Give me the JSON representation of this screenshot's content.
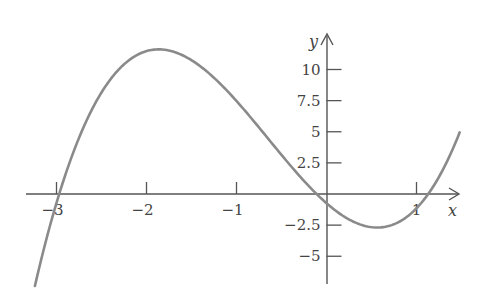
{
  "chart_data": {
    "type": "line",
    "title": "",
    "xlabel": "x",
    "ylabel": "y",
    "xlim": [
      -3.3,
      1.48
    ],
    "ylim": [
      -7.2,
      12.8
    ],
    "grid": false,
    "x_ticks": [
      -3,
      -2,
      -1,
      1
    ],
    "x_tick_labels": [
      "−3",
      "−2",
      "−1",
      "1"
    ],
    "y_ticks": [
      10,
      7.5,
      5,
      2.5,
      -2.5,
      -5
    ],
    "y_tick_labels": [
      "10",
      "7.5",
      "5",
      "2.5",
      "−2.5",
      "−5"
    ],
    "series": [
      {
        "name": "cubic curve",
        "function": "y = 2(x + 2.97)(x + 0.11)(x - 1.13)",
        "color": "#8a8a8a",
        "x_range": [
          -3.24,
          1.48
        ],
        "key_points": [
          {
            "label": "root",
            "x": -2.97,
            "y": 0
          },
          {
            "label": "local max",
            "x": -1.87,
            "y": 11.0
          },
          {
            "label": "root",
            "x": -0.11,
            "y": 0
          },
          {
            "label": "y-intercept",
            "x": 0,
            "y": -0.74
          },
          {
            "label": "local min",
            "x": 0.58,
            "y": -2.7
          },
          {
            "label": "root",
            "x": 1.13,
            "y": 0
          }
        ],
        "x": [
          -3.24,
          -3.0,
          -2.75,
          -2.5,
          -2.25,
          -2.0,
          -1.87,
          -1.75,
          -1.5,
          -1.25,
          -1.0,
          -0.75,
          -0.5,
          -0.25,
          0.0,
          0.25,
          0.5,
          0.58,
          0.75,
          1.0,
          1.13,
          1.25,
          1.48
        ],
        "y": [
          -7.2,
          -0.8,
          4.8,
          8.5,
          10.5,
          11.0,
          11.0,
          10.9,
          10.0,
          8.5,
          6.7,
          4.6,
          2.5,
          0.7,
          -0.74,
          -1.9,
          -2.6,
          -2.7,
          -2.5,
          -1.4,
          0.0,
          1.2,
          4.5
        ]
      }
    ]
  },
  "axes": {
    "x_label": "x",
    "y_label": "y"
  }
}
